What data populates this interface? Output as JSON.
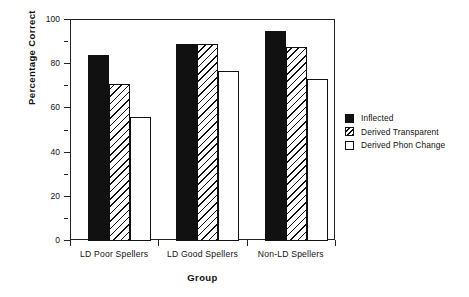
{
  "chart_data": {
    "type": "bar",
    "title": "",
    "xlabel": "Group",
    "ylabel": "Percentage  Correct",
    "categories": [
      "LD Poor Spellers",
      "LD Good Spellers",
      "Non-LD Spellers"
    ],
    "series": [
      {
        "name": "Inflected",
        "style": "filled",
        "values": [
          84,
          89,
          95
        ]
      },
      {
        "name": "Derived Transparent",
        "style": "hatched",
        "values": [
          71,
          89,
          88
        ]
      },
      {
        "name": "Derived Phon Change",
        "style": "open",
        "values": [
          56,
          77,
          73.5
        ]
      }
    ],
    "ylim": [
      0,
      100
    ],
    "ytick_labels": [
      "0",
      "20",
      "40",
      "60",
      "80",
      "100"
    ],
    "ytick_values": [
      0,
      20,
      40,
      60,
      80,
      100
    ],
    "yminor_values": [
      10,
      30,
      50,
      70,
      90
    ],
    "grid": false,
    "legend_position": "right",
    "frame": "box",
    "colors": {
      "axis": "#222222",
      "bar_edge": "#111111",
      "filled": "#111111",
      "background": "#ffffff"
    }
  },
  "legend": {
    "entries": [
      {
        "label": "Inflected",
        "style": "filled"
      },
      {
        "label": "Derived Transparent",
        "style": "hatched"
      },
      {
        "label": "Derived Phon Change",
        "style": "open"
      }
    ]
  },
  "axes": {
    "y_title": "Percentage  Correct",
    "x_title": "Group"
  }
}
